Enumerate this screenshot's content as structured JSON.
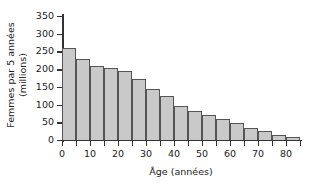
{
  "chart_data": {
    "type": "bar",
    "title": "",
    "subtitle": "",
    "xlabel": "Âge (années)",
    "ylabel_line1": "Femmes par 5 années",
    "ylabel_line2": "(millions)",
    "ylabel": "Femmes par 5 années (millions)",
    "categories": [
      "0-5",
      "5-10",
      "10-15",
      "15-20",
      "20-25",
      "25-30",
      "30-35",
      "35-40",
      "40-45",
      "45-50",
      "50-55",
      "55-60",
      "60-65",
      "65-70",
      "70-75",
      "75-80",
      "80-85"
    ],
    "bin_starts": [
      0,
      5,
      10,
      15,
      20,
      25,
      30,
      35,
      40,
      45,
      50,
      55,
      60,
      65,
      70,
      75,
      80
    ],
    "bin_width": 5,
    "values": [
      260,
      230,
      210,
      204,
      196,
      171,
      145,
      125,
      96,
      81,
      70,
      59,
      48,
      34,
      25,
      15,
      9
    ],
    "ylim": [
      0,
      350
    ],
    "xlim": [
      0,
      85
    ],
    "ytick_values": [
      0,
      50,
      100,
      150,
      200,
      250,
      300,
      350
    ],
    "ytick_labels": [
      "0",
      "50",
      "100",
      "150",
      "200",
      "250",
      "300",
      "350"
    ],
    "xtick_values": [
      0,
      5,
      10,
      15,
      20,
      25,
      30,
      35,
      40,
      45,
      50,
      55,
      60,
      65,
      70,
      75,
      80,
      85
    ],
    "xtick_labeled_values": [
      0,
      10,
      20,
      30,
      40,
      50,
      60,
      70,
      80
    ],
    "xtick_labels": [
      "0",
      "10",
      "20",
      "30",
      "40",
      "50",
      "60",
      "70",
      "80"
    ],
    "grid": false,
    "legend": false,
    "legend_position": "none",
    "colors": {
      "bar_fill": "#c9c9c9",
      "bar_edge": "#555555",
      "axis": "#333333",
      "text": "#1a1a1a",
      "background": "#ffffff"
    }
  }
}
